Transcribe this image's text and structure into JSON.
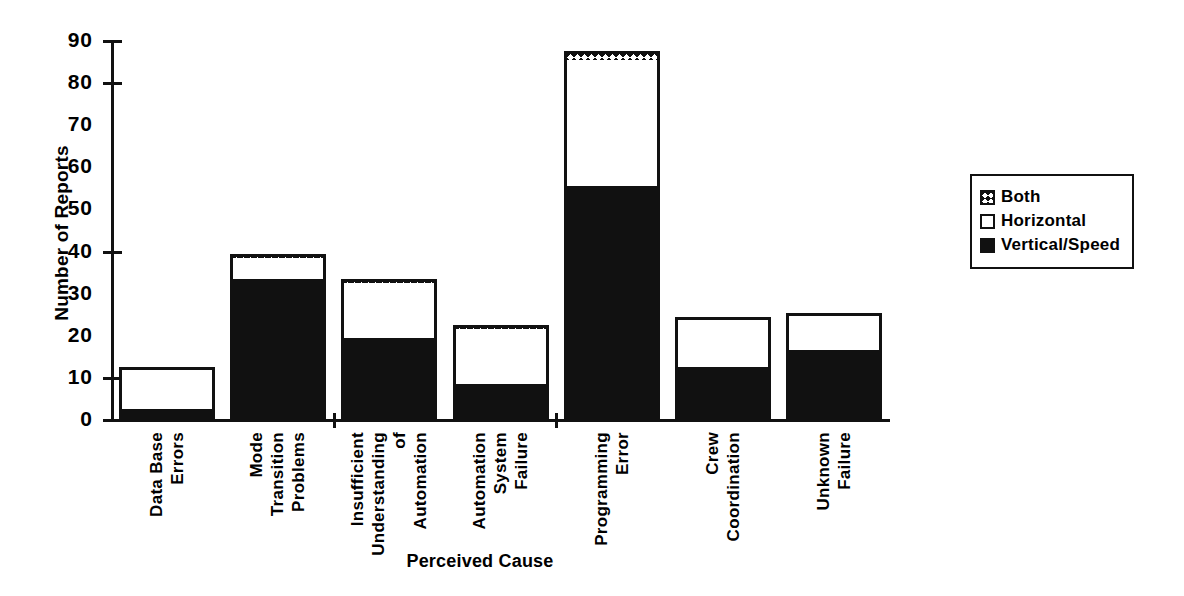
{
  "chart_data": {
    "type": "bar",
    "subtype": "stacked-bar",
    "title": "",
    "xlabel": "Perceived Cause",
    "ylabel": "Number of Reports",
    "ylim": [
      0,
      90
    ],
    "ytick_step": 10,
    "yticks": [
      0,
      10,
      20,
      30,
      40,
      50,
      60,
      70,
      80,
      90
    ],
    "ytick_labels": [
      "0",
      "10",
      "20",
      "30",
      "40",
      "50",
      "60",
      "70",
      "80",
      "90"
    ],
    "grid": false,
    "legend_position": "right",
    "categories": [
      "Data Base Errors",
      "Mode Transition Problems",
      "Insufficient Understanding of Automation",
      "Automation System Failure",
      "Programming Error",
      "Crew Coordination",
      "Unknown Failure"
    ],
    "category_label_lines": [
      [
        "Data Base",
        "Errors"
      ],
      [
        "Mode",
        "Transition",
        "Problems"
      ],
      [
        "Insufficient",
        "Understanding",
        "of",
        "Automation"
      ],
      [
        "Automation",
        "System",
        "Failure"
      ],
      [
        "Programming",
        "Error"
      ],
      [
        "Crew",
        "Coordination"
      ],
      [
        "Unknown",
        "Failure"
      ]
    ],
    "series": [
      {
        "name": "Vertical/Speed",
        "fill": "solid-black",
        "color": "#111111",
        "values": [
          3,
          34,
          20,
          9,
          56,
          13,
          17
        ]
      },
      {
        "name": "Horizontal",
        "fill": "white",
        "color": "#ffffff",
        "values": [
          10,
          5,
          13,
          13,
          30,
          12,
          9
        ]
      },
      {
        "name": "Both",
        "fill": "crosshatch",
        "color": "#111111",
        "values": [
          0,
          1,
          1,
          1,
          2,
          0,
          0
        ]
      }
    ],
    "totals": [
      13,
      40,
      34,
      23,
      88,
      25,
      26
    ]
  },
  "legend": {
    "items": [
      {
        "label": "Both",
        "swatch": "crosshatch-swatch"
      },
      {
        "label": "Horizontal",
        "swatch": "white-swatch"
      },
      {
        "label": "Vertical/Speed",
        "swatch": "black-swatch"
      }
    ]
  },
  "axes": {
    "y_title": "Number of Reports",
    "x_title": "Perceived Cause"
  }
}
